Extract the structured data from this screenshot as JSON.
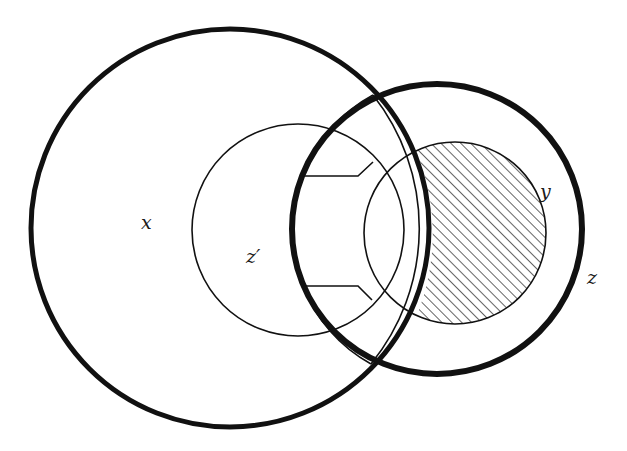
{
  "diagram": {
    "type": "venn-diagram",
    "labels": {
      "x": "x",
      "z_prime": "z′",
      "y": "y",
      "z": "z"
    },
    "regions": [
      {
        "name": "x",
        "description": "large thick-outlined circle on the left"
      },
      {
        "name": "z",
        "description": "thick-outlined circle on the right"
      },
      {
        "name": "z_prime",
        "description": "thin circle inside x with notched C-shaped overlap"
      },
      {
        "name": "y",
        "description": "thin circle inside z"
      },
      {
        "name": "shaded",
        "description": "hatched part of y outside the C-shaped region"
      }
    ],
    "colors": {
      "stroke": "#111111",
      "background": "#ffffff",
      "hatch": "#222222"
    }
  }
}
